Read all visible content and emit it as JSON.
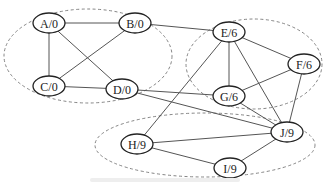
{
  "diagram": {
    "type": "graph",
    "nodes": [
      {
        "id": "A",
        "label": "A/0",
        "x": 49,
        "y": 23
      },
      {
        "id": "B",
        "label": "B/0",
        "x": 135,
        "y": 23
      },
      {
        "id": "C",
        "label": "C/0",
        "x": 49,
        "y": 86
      },
      {
        "id": "D",
        "label": "D/0",
        "x": 122,
        "y": 89
      },
      {
        "id": "E",
        "label": "E/6",
        "x": 229,
        "y": 32
      },
      {
        "id": "F",
        "label": "F/6",
        "x": 304,
        "y": 64
      },
      {
        "id": "G",
        "label": "G/6",
        "x": 229,
        "y": 96
      },
      {
        "id": "H",
        "label": "H/9",
        "x": 137,
        "y": 144
      },
      {
        "id": "I",
        "label": "I/9",
        "x": 230,
        "y": 168
      },
      {
        "id": "J",
        "label": "J/9",
        "x": 287,
        "y": 132
      }
    ],
    "edges": [
      [
        "A",
        "B"
      ],
      [
        "A",
        "C"
      ],
      [
        "A",
        "D"
      ],
      [
        "B",
        "C"
      ],
      [
        "B",
        "E"
      ],
      [
        "C",
        "D"
      ],
      [
        "D",
        "G"
      ],
      [
        "D",
        "J"
      ],
      [
        "E",
        "F"
      ],
      [
        "E",
        "G"
      ],
      [
        "E",
        "H"
      ],
      [
        "E",
        "J"
      ],
      [
        "F",
        "G"
      ],
      [
        "F",
        "J"
      ],
      [
        "G",
        "J"
      ],
      [
        "H",
        "J"
      ],
      [
        "H",
        "I"
      ],
      [
        "I",
        "J"
      ]
    ],
    "clusters": [
      {
        "label": "cluster-0",
        "cx": 88,
        "cy": 56,
        "rx": 84,
        "ry": 47,
        "members": [
          "A",
          "B",
          "C",
          "D"
        ]
      },
      {
        "label": "cluster-6",
        "cx": 254,
        "cy": 64,
        "rx": 68,
        "ry": 45,
        "members": [
          "E",
          "F",
          "G"
        ]
      },
      {
        "label": "cluster-9",
        "cx": 205,
        "cy": 145,
        "rx": 110,
        "ry": 32,
        "members": [
          "H",
          "I",
          "J"
        ]
      }
    ]
  },
  "caption": ""
}
